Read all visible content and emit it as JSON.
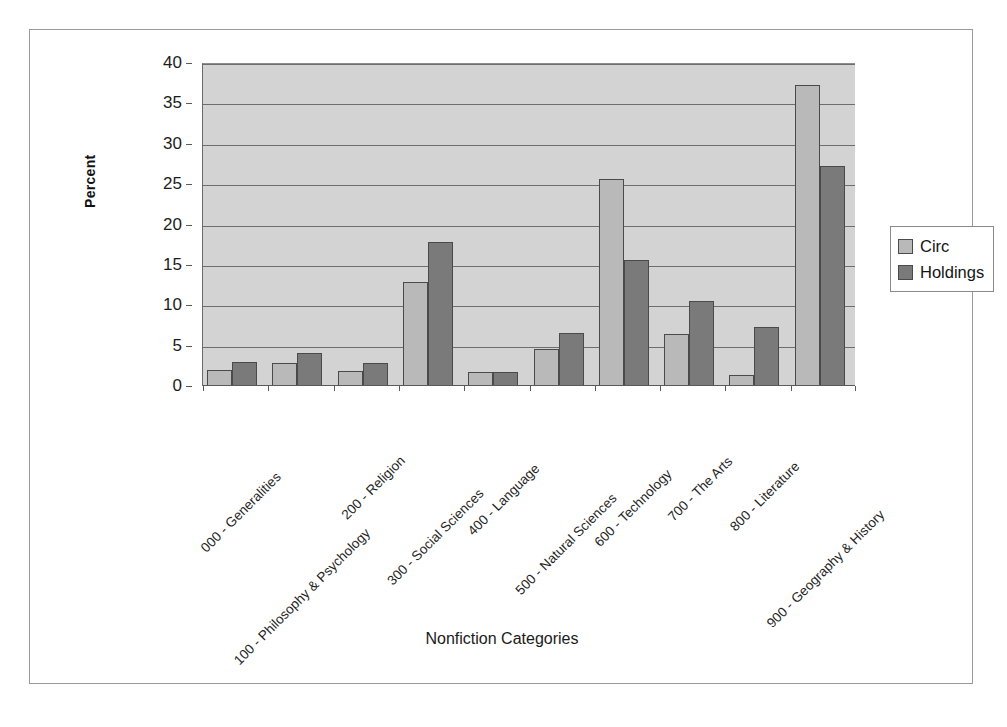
{
  "chart_data": {
    "type": "bar",
    "title": "",
    "xlabel": "Nonfiction Categories",
    "ylabel": "Percent",
    "ylim": [
      0,
      40
    ],
    "yticks": [
      0,
      5,
      10,
      15,
      20,
      25,
      30,
      35,
      40
    ],
    "grid": true,
    "legend_position": "right",
    "categories": [
      "000 - Generalities",
      "100 - Philosophy & Psychology",
      "200 - Religion",
      "300 - Social Sciences",
      "400 - Language",
      "500 - Natural Sciences",
      "600 - Technology",
      "700 - The Arts",
      "800 - Literature",
      "900 - Geography & History"
    ],
    "series": [
      {
        "name": "Circ",
        "color": "#b9b9b9",
        "values": [
          2.0,
          2.9,
          1.8,
          12.9,
          1.7,
          4.6,
          25.6,
          6.4,
          1.4,
          37.3
        ]
      },
      {
        "name": "Holdings",
        "color": "#7a7a7a",
        "values": [
          3.0,
          4.1,
          2.9,
          17.8,
          1.7,
          6.6,
          15.6,
          10.5,
          7.3,
          27.3
        ]
      }
    ]
  },
  "legend": {
    "items": [
      {
        "label": "Circ",
        "icon": "legend-swatch-circ"
      },
      {
        "label": "Holdings",
        "icon": "legend-swatch-holdings"
      }
    ]
  },
  "axes": {
    "y_title": "Percent",
    "x_title": "Nonfiction Categories",
    "y_tick_labels": [
      "40",
      "35",
      "30",
      "25",
      "20",
      "15",
      "10",
      "5",
      "0"
    ]
  }
}
